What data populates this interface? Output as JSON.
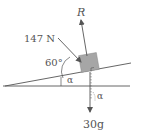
{
  "diagram": {
    "forces": {
      "reaction": {
        "label": "R"
      },
      "push": {
        "label": "147 N",
        "angle_label": "60°"
      },
      "weight": {
        "label": "30g"
      }
    },
    "incline_angle_label": "α",
    "weight_angle_label": "α",
    "colors": {
      "line": "#555555",
      "block": "#a6a6a6",
      "text": "#555555"
    }
  }
}
